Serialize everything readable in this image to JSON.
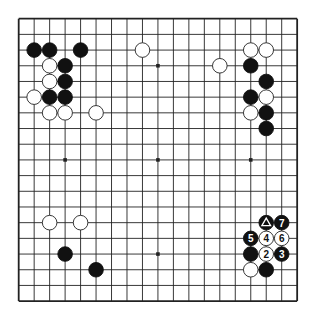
{
  "board": {
    "size": 19,
    "origin": {
      "x": 18.7,
      "y": 18.7
    },
    "spacing": {
      "x": 15.47,
      "y": 15.69
    },
    "stone_radius": 7.3,
    "colors": {
      "background": "#ffffff",
      "line": "#222222",
      "black_stone": "#111111",
      "white_stone": "#ffffff",
      "white_stone_outline": "#222222",
      "label_on_black": "#ffffff",
      "label_on_white": "#111111"
    },
    "star_points": [
      [
        3,
        3
      ],
      [
        9,
        3
      ],
      [
        15,
        3
      ],
      [
        3,
        9
      ],
      [
        9,
        9
      ],
      [
        15,
        9
      ],
      [
        3,
        15
      ],
      [
        9,
        15
      ],
      [
        15,
        15
      ]
    ]
  },
  "stones": [
    {
      "color": "black",
      "col": 1,
      "row": 2
    },
    {
      "color": "black",
      "col": 2,
      "row": 2
    },
    {
      "color": "black",
      "col": 4,
      "row": 2
    },
    {
      "color": "white",
      "col": 8,
      "row": 2
    },
    {
      "color": "white",
      "col": 15,
      "row": 2
    },
    {
      "color": "white",
      "col": 16,
      "row": 2
    },
    {
      "color": "white",
      "col": 2,
      "row": 3
    },
    {
      "color": "black",
      "col": 3,
      "row": 3
    },
    {
      "color": "white",
      "col": 13,
      "row": 3
    },
    {
      "color": "black",
      "col": 15,
      "row": 3
    },
    {
      "color": "white",
      "col": 2,
      "row": 4
    },
    {
      "color": "black",
      "col": 3,
      "row": 4
    },
    {
      "color": "black",
      "col": 16,
      "row": 4
    },
    {
      "color": "white",
      "col": 1,
      "row": 5
    },
    {
      "color": "black",
      "col": 2,
      "row": 5
    },
    {
      "color": "black",
      "col": 3,
      "row": 5
    },
    {
      "color": "black",
      "col": 15,
      "row": 5
    },
    {
      "color": "white",
      "col": 16,
      "row": 5
    },
    {
      "color": "white",
      "col": 2,
      "row": 6
    },
    {
      "color": "white",
      "col": 3,
      "row": 6
    },
    {
      "color": "white",
      "col": 5,
      "row": 6
    },
    {
      "color": "white",
      "col": 15,
      "row": 6
    },
    {
      "color": "black",
      "col": 16,
      "row": 6
    },
    {
      "color": "black",
      "col": 16,
      "row": 7
    },
    {
      "color": "white",
      "col": 2,
      "row": 13
    },
    {
      "color": "white",
      "col": 4,
      "row": 13
    },
    {
      "color": "black",
      "col": 16,
      "row": 13,
      "marker": "triangle"
    },
    {
      "color": "black",
      "col": 17,
      "row": 13,
      "label": "7"
    },
    {
      "color": "black",
      "col": 15,
      "row": 14,
      "label": "5"
    },
    {
      "color": "white",
      "col": 16,
      "row": 14,
      "label": "4"
    },
    {
      "color": "white",
      "col": 17,
      "row": 14,
      "label": "6"
    },
    {
      "color": "black",
      "col": 3,
      "row": 15
    },
    {
      "color": "black",
      "col": 15,
      "row": 15
    },
    {
      "color": "white",
      "col": 16,
      "row": 15,
      "label": "2"
    },
    {
      "color": "black",
      "col": 17,
      "row": 15,
      "label": "3"
    },
    {
      "color": "black",
      "col": 5,
      "row": 16
    },
    {
      "color": "white",
      "col": 15,
      "row": 16
    },
    {
      "color": "black",
      "col": 16,
      "row": 16
    }
  ]
}
